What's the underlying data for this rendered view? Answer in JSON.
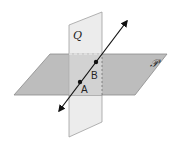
{
  "diagram": {
    "planes": [
      {
        "name": "Q",
        "label": "Q",
        "fill": "#e9e9e9",
        "stroke": "#9a9a9a"
      },
      {
        "name": "P",
        "label": "𝒫",
        "fill": "#b9b9b9",
        "stroke": "#8a8a8a"
      }
    ],
    "points": [
      {
        "name": "A",
        "label": "A"
      },
      {
        "name": "B",
        "label": "B"
      }
    ],
    "line": {
      "color": "#111111",
      "arrows": "both"
    }
  }
}
